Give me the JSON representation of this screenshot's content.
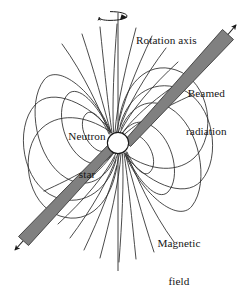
{
  "figure": {
    "background_color": "#ffffff",
    "width": 246,
    "height": 279
  },
  "labels": {
    "rotation_axis": "Rotation axis",
    "beamed_radiation_line1": "Beamed",
    "beamed_radiation_line2": "radiation",
    "neutron_star_line1": "Neutron",
    "neutron_star_line2": "star",
    "magnetic_field_line1": "Magnetic",
    "magnetic_field_line2": "field"
  },
  "colors": {
    "beam_fill": "#808080",
    "beam_stroke": "#3a3a3a",
    "field_line": "#2b2b2b",
    "axis_line": "#2b2b2b",
    "star_fill": "#ffffff",
    "star_stroke": "#1a1a1a",
    "text": "#151515"
  },
  "geometry": {
    "star_center_x": 118,
    "star_center_y": 143,
    "star_radius": 11,
    "rotation_axis_x": 118,
    "rotation_axis_top_y": 13,
    "rotation_axis_bottom_y": 271,
    "magnetic_axis_angle_deg": 35,
    "spin_indicator_cx": 113,
    "spin_indicator_cy": 16,
    "spin_indicator_rx": 14,
    "spin_indicator_ry": 4.5,
    "beam_upper_tip_x": 231,
    "beam_upper_tip_y": 22,
    "beam_lower_tip_x": 22,
    "beam_lower_tip_y": 259
  },
  "elements": {
    "neutron_star": "neutron-star-body",
    "rotation_axis": "rotation-axis-line",
    "spin_indicator": "rotation-direction-arrow",
    "upper_beam": "beamed-radiation-cone-upper",
    "lower_beam": "beamed-radiation-cone-lower",
    "field_lines": "magnetic-dipole-field-lines"
  },
  "field_line_counts": {
    "closed_loops_upper_left": 4,
    "closed_loops_lower_right": 4,
    "open_fan_lines_upper": 9,
    "open_fan_lines_lower": 9
  }
}
